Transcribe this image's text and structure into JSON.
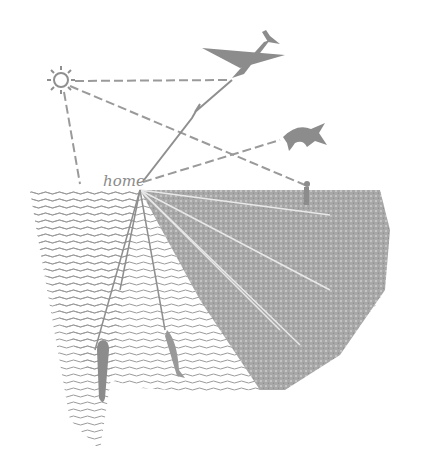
{
  "illustration": {
    "home_label": "home",
    "ink_color": "#8f8f8f",
    "elements": [
      "sun",
      "airplane",
      "bird",
      "home",
      "person",
      "water",
      "ground",
      "rocket",
      "fish"
    ]
  }
}
